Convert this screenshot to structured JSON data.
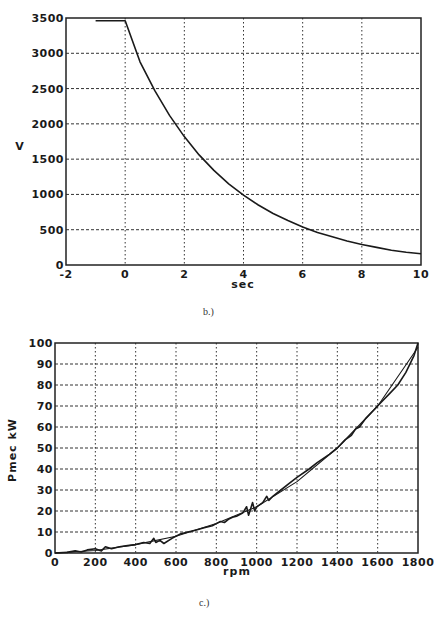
{
  "chart_data": [
    {
      "id": "b",
      "type": "line",
      "caption": "b.)",
      "title": "",
      "xlabel": "sec",
      "ylabel": "V",
      "xlim": [
        -2,
        10
      ],
      "ylim": [
        0,
        3500
      ],
      "xticks": [
        -2,
        0,
        2,
        4,
        6,
        8,
        10
      ],
      "yticks": [
        0,
        500,
        1000,
        1500,
        2000,
        2500,
        3000,
        3500
      ],
      "grid": true,
      "legend": null,
      "series": [
        {
          "name": "V",
          "x": [
            -1,
            0,
            0.5,
            1,
            1.5,
            2,
            2.5,
            3,
            3.5,
            4,
            4.5,
            5,
            5.5,
            6,
            6.5,
            7,
            7.5,
            8,
            8.5,
            9,
            9.5,
            10
          ],
          "y": [
            3460,
            3460,
            2880,
            2470,
            2120,
            1820,
            1560,
            1340,
            1150,
            990,
            850,
            730,
            630,
            540,
            460,
            400,
            340,
            290,
            250,
            210,
            180,
            160
          ]
        }
      ],
      "annotations": []
    },
    {
      "id": "c",
      "type": "line",
      "caption": "c.)",
      "title": "",
      "xlabel": "rpm",
      "ylabel": "Pmec kW",
      "xlim": [
        0,
        1800
      ],
      "ylim": [
        0,
        100
      ],
      "xticks": [
        0,
        200,
        400,
        600,
        800,
        1000,
        1200,
        1400,
        1600,
        1800
      ],
      "yticks": [
        0,
        10,
        20,
        30,
        40,
        50,
        60,
        70,
        80,
        90,
        100
      ],
      "grid": true,
      "legend": null,
      "series": [
        {
          "name": "measured",
          "x": [
            0,
            60,
            100,
            130,
            160,
            200,
            230,
            250,
            280,
            320,
            360,
            400,
            440,
            470,
            490,
            500,
            520,
            540,
            580,
            620,
            660,
            700,
            740,
            780,
            800,
            820,
            840,
            860,
            880,
            900,
            930,
            950,
            960,
            980,
            990,
            1000,
            1030,
            1050,
            1060,
            1080,
            1120,
            1160,
            1200,
            1260,
            1300,
            1360,
            1400,
            1440,
            1470,
            1490,
            1510,
            1540,
            1580,
            1620,
            1660,
            1700,
            1740,
            1780,
            1800
          ],
          "y": [
            0,
            0.3,
            1,
            0.5,
            1.5,
            2,
            1,
            3,
            2,
            3,
            3.5,
            4,
            5,
            4.5,
            7,
            5,
            6,
            4.5,
            7,
            9,
            10,
            11,
            12,
            13,
            14,
            15,
            14.5,
            16,
            17,
            17.5,
            19,
            22,
            18,
            24,
            20,
            22,
            24,
            27,
            25,
            27,
            30,
            33,
            36,
            40,
            43,
            47,
            50,
            54,
            56,
            59,
            60,
            64,
            68,
            72,
            76,
            80,
            86,
            94,
            100
          ]
        },
        {
          "name": "model",
          "x": [
            0,
            200,
            400,
            600,
            800,
            1000,
            1200,
            1400,
            1600,
            1800
          ],
          "y": [
            0,
            1.2,
            4,
            8,
            14,
            22,
            34,
            50,
            70,
            98
          ]
        }
      ],
      "annotations": []
    }
  ],
  "colors": {
    "line": "#1a1a1a",
    "grid": "#333333",
    "axis": "#222222"
  }
}
